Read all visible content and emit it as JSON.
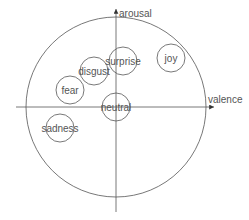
{
  "diagram": {
    "type": "circumplex-model",
    "axes": {
      "x_label": "valence",
      "y_label": "arousal"
    },
    "outer_circle": {
      "cx": 116,
      "cy": 107,
      "r": 90
    },
    "emotions": [
      {
        "label": "joy",
        "cx": 171,
        "cy": 58,
        "r": 14
      },
      {
        "label": "surprise",
        "cx": 123,
        "cy": 61,
        "r": 14
      },
      {
        "label": "disgust",
        "cx": 94,
        "cy": 71,
        "r": 14
      },
      {
        "label": "fear",
        "cx": 70,
        "cy": 90,
        "r": 14
      },
      {
        "label": "neutral",
        "cx": 116,
        "cy": 107,
        "r": 14
      },
      {
        "label": "sadness",
        "cx": 60,
        "cy": 128,
        "r": 14
      }
    ],
    "colors": {
      "stroke": "#555555",
      "text": "#555555",
      "background": "#ffffff"
    }
  }
}
